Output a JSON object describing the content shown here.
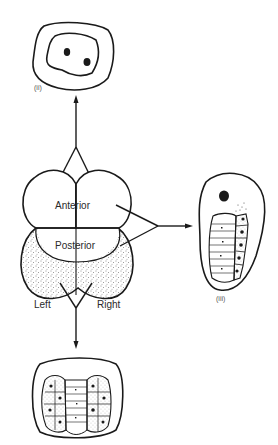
{
  "diagram": {
    "type": "embryo-fate-diagram",
    "center": {
      "regions": [
        {
          "id": "anterior",
          "label": "Anterior"
        },
        {
          "id": "posterior",
          "label": "Posterior"
        }
      ],
      "sides": {
        "left": "Left",
        "right": "Right"
      }
    },
    "outcomes": [
      {
        "id": "ii",
        "label": "(ii)",
        "from": "anterior",
        "position": "top"
      },
      {
        "id": "iii",
        "label": "(iii)",
        "from": "anterior+posterior",
        "position": "right"
      },
      {
        "id": "i",
        "label": "",
        "from": "left+right posterior",
        "position": "bottom"
      }
    ],
    "colors": {
      "ink": "#1a1a1a",
      "background": "#ffffff"
    }
  }
}
